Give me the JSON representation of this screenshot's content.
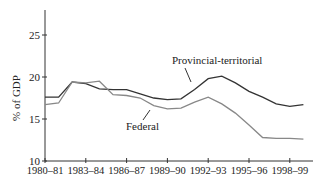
{
  "chart_data": {
    "type": "line",
    "title": "",
    "xlabel": "",
    "ylabel": "% of GDP",
    "ylim": [
      10,
      28
    ],
    "yticks": [
      10,
      15,
      20,
      25
    ],
    "xtick_labels": [
      "1980–81",
      "1983–84",
      "1986–87",
      "1989–90",
      "1992–93",
      "1995–96",
      "1998–99"
    ],
    "x": [
      "1980–81",
      "1981–82",
      "1982–83",
      "1983–84",
      "1984–85",
      "1985–86",
      "1986–87",
      "1987–88",
      "1988–89",
      "1989–90",
      "1990–91",
      "1991–92",
      "1992–93",
      "1993–94",
      "1994–95",
      "1995–96",
      "1996–97",
      "1997–98",
      "1998–99",
      "1999–00"
    ],
    "series": [
      {
        "name": "Provincial-territorial",
        "color": "#333333",
        "values": [
          17.6,
          17.6,
          19.4,
          19.2,
          18.6,
          18.5,
          18.5,
          18.0,
          17.5,
          17.3,
          17.4,
          18.5,
          19.8,
          20.1,
          19.3,
          18.3,
          17.6,
          16.8,
          16.5,
          16.7
        ]
      },
      {
        "name": "Federal",
        "color": "#888888",
        "values": [
          16.7,
          16.9,
          19.4,
          19.3,
          19.5,
          17.9,
          17.8,
          17.5,
          16.6,
          16.2,
          16.3,
          17.0,
          17.6,
          16.8,
          15.7,
          14.3,
          12.8,
          12.7,
          12.7,
          12.6
        ]
      }
    ],
    "annotations": [
      {
        "text": "Provincial-territorial",
        "target": "Provincial-territorial"
      },
      {
        "text": "Federal",
        "target": "Federal"
      }
    ],
    "grid": false,
    "legend": "none (inline labels with arrows)"
  }
}
